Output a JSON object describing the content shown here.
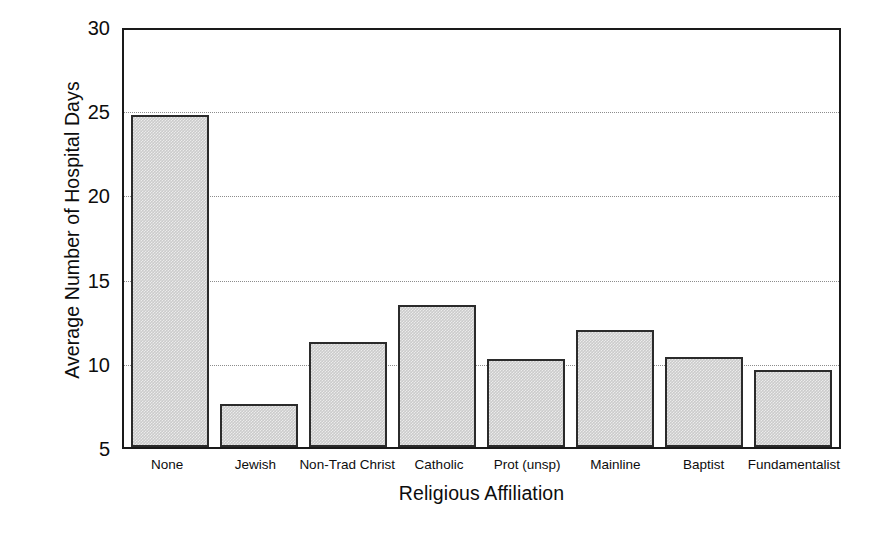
{
  "chart_data": {
    "type": "bar",
    "title": "",
    "xlabel": "Religious Affiliation",
    "ylabel": "Average Number of Hospital Days",
    "categories": [
      "None",
      "Jewish",
      "Non-Trad Christ",
      "Catholic",
      "Prot (unsp)",
      "Mainline",
      "Baptist",
      "Fundamentalist"
    ],
    "values": [
      24.9,
      7.6,
      11.3,
      13.5,
      10.3,
      12.0,
      10.4,
      9.6
    ],
    "ylim": [
      5,
      30
    ],
    "yticks": [
      5,
      10,
      15,
      20,
      25,
      30
    ],
    "ytick_labels": [
      "5",
      "10",
      "15",
      "20",
      "25",
      "30"
    ],
    "gridlines": [
      10,
      15,
      20,
      25
    ],
    "grid": true,
    "legend": "none",
    "bar_fill_color": "#cbcbcb",
    "bar_edge_color": "#2b2b2b",
    "axis_color": "#1a1a1a",
    "grid_color": "#8c8c8c",
    "background_color": "#ffffff"
  }
}
